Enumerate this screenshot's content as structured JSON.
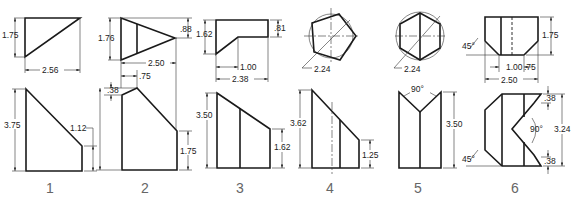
{
  "problems": [
    {
      "number": "1",
      "dims": {
        "top_height": "1.75",
        "top_width": "2.56",
        "front_height": "3.75",
        "front_right": "1.12"
      }
    },
    {
      "number": "2",
      "dims": {
        "top_height": "1.76",
        "top_tip": ".88",
        "width": "2.50",
        "offset": ".75",
        "step": ".38",
        "front_height": "3.75",
        "front_right": "1.75"
      }
    },
    {
      "number": "3",
      "dims": {
        "top_height": "1.62",
        "top_right": ".81",
        "inner": "1.00",
        "width": "2.38",
        "front_height": "3.50",
        "front_right": "1.62"
      }
    },
    {
      "number": "4",
      "dims": {
        "diameter": "2.24",
        "front_height": "3.62",
        "front_right": "1.25"
      }
    },
    {
      "number": "5",
      "dims": {
        "diameter": "2.24",
        "angle": "90°",
        "front_height": "3.50"
      }
    },
    {
      "number": "6",
      "dims": {
        "angle_top": "45°",
        "top_height": "1.75",
        "inner": "1.00",
        "chamfer": ".75",
        "width": "2.50",
        "step_top": ".38",
        "angle": "90°",
        "front_height": "3.24",
        "step_bottom": ".38",
        "angle_bottom": "45°"
      }
    }
  ]
}
